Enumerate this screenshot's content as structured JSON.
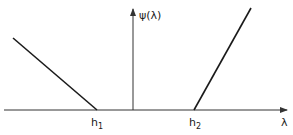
{
  "diagram": {
    "y_axis_label": "ψ(λ)",
    "x_axis_label": "λ",
    "points": {
      "h1_label": "h",
      "h1_sub": "1",
      "h2_label": "h",
      "h2_sub": "2"
    },
    "segments": [
      {
        "name": "left-branch",
        "from": [
          13,
          38
        ],
        "to": [
          97,
          110
        ]
      },
      {
        "name": "right-branch",
        "from": [
          194,
          110
        ],
        "to": [
          251,
          8
        ]
      }
    ],
    "colors": {
      "line": "#1a1a1a",
      "axis": "#333333",
      "background": "#ffffff"
    }
  }
}
